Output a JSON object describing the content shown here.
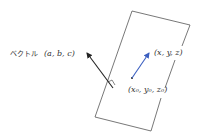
{
  "diagram": {
    "plane": {
      "corners": [
        [
          132,
          11
        ],
        [
          190,
          25
        ],
        [
          151,
          131
        ],
        [
          95,
          117
        ]
      ],
      "color": "#555555"
    },
    "normal_vector": {
      "label_prefix": "ベクトル",
      "label_math": "(a, b, c)",
      "from": [
        113,
        88
      ],
      "to": [
        86,
        52
      ],
      "color": "#222222",
      "right_angle_mark": true
    },
    "position_vector": {
      "start_label": "(x₀, y₀, z₀)",
      "end_label": "(x, y, z)",
      "from": [
        132,
        78
      ],
      "to": [
        150,
        52
      ],
      "color": "#3b5fc0"
    }
  }
}
